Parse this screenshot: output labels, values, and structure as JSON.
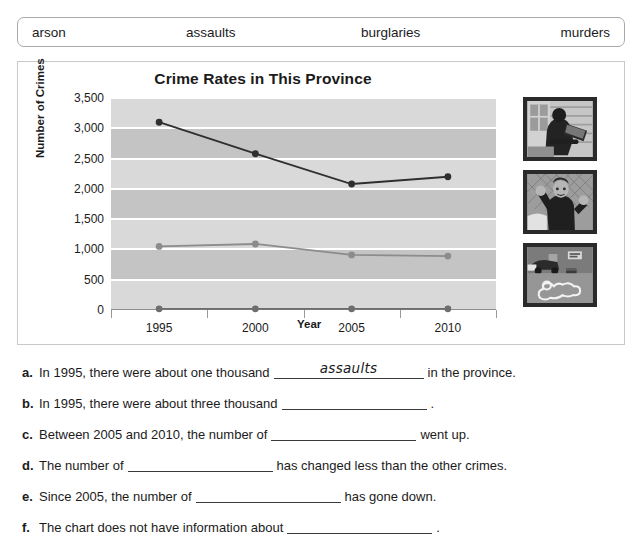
{
  "word_bank": {
    "words": [
      "arson",
      "assaults",
      "burglaries",
      "murders"
    ]
  },
  "chart_data": {
    "type": "line",
    "title": "Crime Rates in This Province",
    "xlabel": "Year",
    "ylabel": "Number of Crimes",
    "categories": [
      "1995",
      "2000",
      "2005",
      "2010"
    ],
    "ylim": [
      0,
      3500
    ],
    "ytick_labels": [
      "0",
      "500",
      "1,000",
      "1,500",
      "2,000",
      "2,500",
      "3,000",
      "3,500"
    ],
    "ytick_values": [
      0,
      500,
      1000,
      1500,
      2000,
      2500,
      3000,
      3500
    ],
    "grid": true,
    "legend": "none",
    "series": [
      {
        "name": "burglaries",
        "values": [
          3100,
          2580,
          2080,
          2200
        ],
        "color": "#2f2f2f"
      },
      {
        "name": "assaults",
        "values": [
          1050,
          1090,
          910,
          890
        ],
        "color": "#8c8c8c"
      },
      {
        "name": "murders",
        "values": [
          20,
          20,
          20,
          20
        ],
        "color": "#6e6e6e"
      }
    ]
  },
  "photos": [
    {
      "name": "burglary-photo",
      "alt": "burglar climbing through a window with a stolen item"
    },
    {
      "name": "assault-photo",
      "alt": "man raising a fist in front of a chain-link fence"
    },
    {
      "name": "murder-photo",
      "alt": "chalk body outline at a crime scene"
    }
  ],
  "questions": [
    {
      "letter": "a.",
      "before": "In 1995, there were about one thousand",
      "answer": "assaults",
      "after": "in the province.",
      "blank_width": 150
    },
    {
      "letter": "b.",
      "before": "In 1995, there were about three thousand",
      "answer": "",
      "after": ".",
      "blank_width": 145
    },
    {
      "letter": "c.",
      "before": "Between 2005 and 2010, the number of",
      "answer": "",
      "after": "went up.",
      "blank_width": 145
    },
    {
      "letter": "d.",
      "before": "The number of",
      "answer": "",
      "after": "has changed less than the other crimes.",
      "blank_width": 145
    },
    {
      "letter": "e.",
      "before": "Since 2005, the number of",
      "answer": "",
      "after": "has gone down.",
      "blank_width": 145
    },
    {
      "letter": "f.",
      "before": "The chart does not have information about",
      "answer": "",
      "after": ".",
      "blank_width": 145
    }
  ]
}
